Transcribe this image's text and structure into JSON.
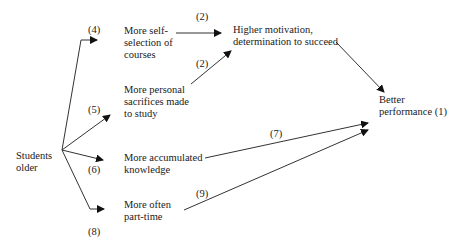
{
  "diagram": {
    "nodes": {
      "students_older": {
        "line1": "Students",
        "line2": "older"
      },
      "self_selection": {
        "line1": "More self-",
        "line2": "selection of",
        "line3": "courses"
      },
      "sacrifices": {
        "line1": "More personal",
        "line2": "sacrifices made",
        "line3": "to study"
      },
      "knowledge": {
        "line1": "More accumulated",
        "line2": "knowledge"
      },
      "part_time": {
        "line1": "More often",
        "line2": "part-time"
      },
      "motivation": {
        "line1": "Higher motivation,",
        "line2": "determination to succeed"
      },
      "performance": {
        "line1": "Better",
        "line2": "performance (1)"
      }
    },
    "edge_labels": {
      "to_self_selection": "(4)",
      "to_sacrifices": "(5)",
      "to_knowledge": "(6)",
      "to_part_time": "(8)",
      "self_selection_to_motivation": "(2)",
      "sacrifices_to_motivation": "(2)",
      "knowledge_to_performance": "(7)",
      "part_time_to_performance": "(9)"
    },
    "edges": [
      {
        "from": "students_older",
        "to": "self_selection",
        "label": "(4)"
      },
      {
        "from": "students_older",
        "to": "sacrifices",
        "label": "(5)"
      },
      {
        "from": "students_older",
        "to": "knowledge",
        "label": "(6)"
      },
      {
        "from": "students_older",
        "to": "part_time",
        "label": "(8)"
      },
      {
        "from": "self_selection",
        "to": "motivation",
        "label": "(2)"
      },
      {
        "from": "sacrifices",
        "to": "motivation",
        "label": "(2)"
      },
      {
        "from": "motivation",
        "to": "performance",
        "label": ""
      },
      {
        "from": "knowledge",
        "to": "performance",
        "label": "(7)"
      },
      {
        "from": "part_time",
        "to": "performance",
        "label": "(9)"
      }
    ],
    "colors": {
      "line": "#333333",
      "text": "#1a1a1a",
      "background": "#ffffff"
    }
  }
}
